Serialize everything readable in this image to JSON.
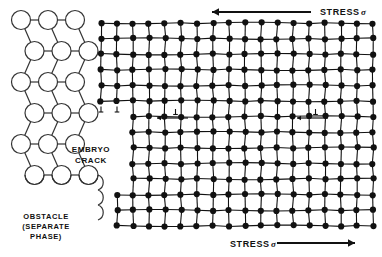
{
  "figure": {
    "background_color": "#ffffff",
    "ink_color": "#111111",
    "width": 382,
    "height": 257
  },
  "labels": {
    "stress_top": "STRESS",
    "stress_top_symbol": "σ",
    "stress_bottom": "STRESS",
    "stress_bottom_symbol": "σ",
    "embryo_crack_line1": "EMBRYO",
    "embryo_crack_line2": "CRACK",
    "obstacle_line1": "OBSTACLE",
    "obstacle_line2": "(SEPARATE",
    "obstacle_line3": "PHASE)"
  },
  "arrows": {
    "top": {
      "direction": "left",
      "x_start": 311,
      "x_end": 212,
      "y": 12
    },
    "bottom": {
      "direction": "right",
      "x_start": 277,
      "x_end": 355,
      "y": 243
    },
    "interior": [
      {
        "direction": "left",
        "x_start": 188,
        "x_end": 157,
        "y": 118,
        "symbol": "⊥"
      },
      {
        "direction": "left",
        "x_start": 328,
        "x_end": 297,
        "y": 118,
        "symbol": "⊥"
      }
    ]
  },
  "dislocations": {
    "symbol": "⊥",
    "crack_tip": [
      {
        "x": 101,
        "y": 112
      },
      {
        "x": 117,
        "y": 112
      }
    ]
  },
  "obstacle_lattice": {
    "type": "open-circle-staggered",
    "circle_radius": 9.5,
    "columns": 3,
    "rows": 6,
    "x_origin": 21,
    "y_origin": 20,
    "x_spacing": 27,
    "y_spacing": 31,
    "stagger_offset": 13.5,
    "fill": "#ffffff",
    "stroke": "#333333"
  },
  "crystal_lattice": {
    "type": "filled-dot-square",
    "atom_radius": 3.1,
    "x_origin": 101,
    "y_origin": 23,
    "x_spacing": 16.0,
    "y_spacing": 15.6,
    "columns": 18,
    "rows": 14,
    "fill": "#111111",
    "upper_block_rows": 6,
    "crack_step_column": 2,
    "lower_block_start_column": 2,
    "bottom_block_start_column": 1,
    "bottom_block_start_row": 11
  },
  "chart_data": {
    "type": "diagram",
    "regions": [
      {
        "name": "obstacle",
        "label": "OBSTACLE (SEPARATE PHASE)",
        "representation": "open circles"
      },
      {
        "name": "matrix",
        "label": "crystal lattice",
        "representation": "filled dots"
      },
      {
        "name": "embryo crack",
        "label": "EMBRYO CRACK",
        "representation": "void / lattice offset"
      }
    ]
  }
}
